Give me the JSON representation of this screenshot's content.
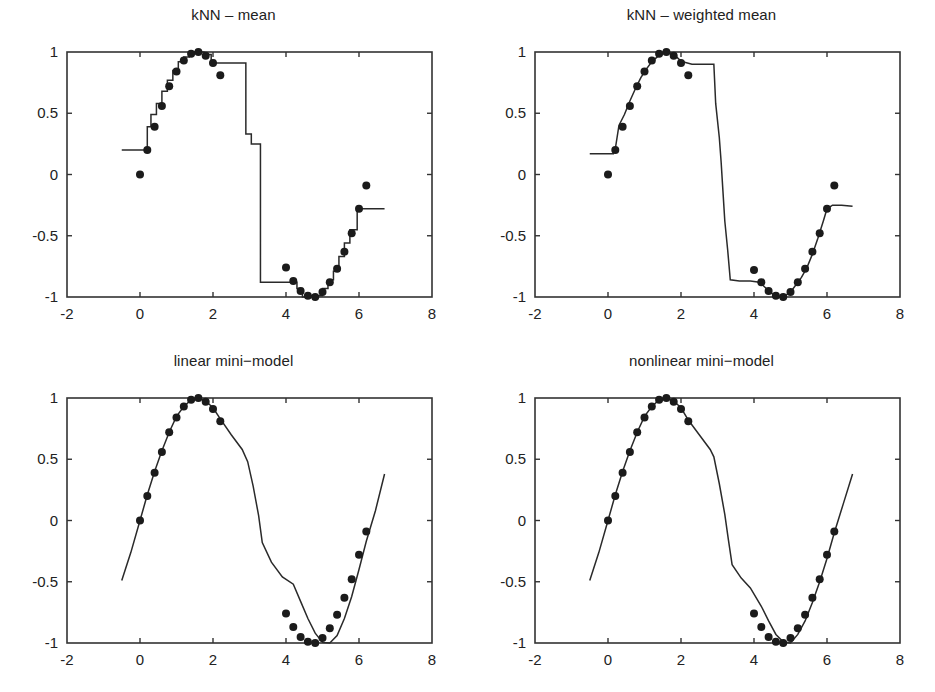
{
  "figure": {
    "width": 935,
    "height": 692,
    "background": "#ffffff",
    "line_color": "#2a2a2a",
    "marker_color": "#1b1b1b",
    "axis_color": "#333333",
    "layout": "2x2 grid of subplots"
  },
  "panels": [
    {
      "id": "knn-mean",
      "title": "kNN – mean"
    },
    {
      "id": "knn-weighted-mean",
      "title": "kNN – weighted mean"
    },
    {
      "id": "linear-mini-model",
      "title": "linear mini−model"
    },
    {
      "id": "nonlinear-mini-model",
      "title": "nonlinear mini−model"
    }
  ],
  "axes": {
    "xlim": [
      -2,
      8
    ],
    "ylim": [
      -1,
      1
    ],
    "xticks": [
      -2,
      0,
      2,
      4,
      6,
      8
    ],
    "xticklabels": [
      "-2",
      "0",
      "2",
      "4",
      "6",
      "8"
    ],
    "yticks": [
      -1,
      -0.5,
      0,
      0.5,
      1
    ],
    "yticklabels": [
      "-1",
      "-0.5",
      "0",
      "0.5",
      "1"
    ],
    "grid": false,
    "box": true
  },
  "chart_data": [
    {
      "type": "line",
      "id": "knn-mean",
      "title": "kNN – mean",
      "xlabel": "",
      "ylabel": "",
      "xlim": [
        -2,
        8
      ],
      "ylim": [
        -1,
        1
      ],
      "grid": false,
      "legend": "none",
      "series": [
        {
          "name": "training data",
          "style": "scatter",
          "marker": "filled-circle",
          "x": [
            0.0,
            0.2,
            0.4,
            0.6,
            0.8,
            1.0,
            1.2,
            1.4,
            1.6,
            1.8,
            2.0,
            2.2,
            4.0,
            4.2,
            4.4,
            4.6,
            4.8,
            5.0,
            5.2,
            5.4,
            5.6,
            5.8,
            6.0,
            6.2
          ],
          "y": [
            0.0,
            0.2,
            0.39,
            0.56,
            0.72,
            0.84,
            0.93,
            0.985,
            1.0,
            0.97,
            0.91,
            0.81,
            -0.76,
            -0.87,
            -0.95,
            -0.99,
            -1.0,
            -0.96,
            -0.88,
            -0.77,
            -0.63,
            -0.48,
            -0.28,
            -0.09
          ]
        },
        {
          "name": "kNN mean prediction",
          "style": "staircase",
          "x": [
            -0.5,
            0.2,
            0.2,
            0.3,
            0.3,
            0.45,
            0.45,
            0.6,
            0.6,
            0.75,
            0.75,
            0.9,
            0.9,
            1.05,
            1.05,
            1.2,
            1.2,
            1.35,
            1.35,
            1.5,
            1.5,
            1.75,
            1.75,
            1.95,
            1.95,
            2.05,
            2.05,
            2.9,
            2.9,
            3.05,
            3.05,
            3.3,
            3.3,
            4.3,
            4.3,
            4.45,
            4.45,
            4.6,
            4.6,
            5.0,
            5.0,
            5.15,
            5.15,
            5.3,
            5.3,
            5.45,
            5.45,
            5.6,
            5.6,
            5.75,
            5.75,
            5.95,
            5.95,
            6.7
          ],
          "y": [
            0.2,
            0.2,
            0.39,
            0.39,
            0.49,
            0.49,
            0.58,
            0.58,
            0.68,
            0.68,
            0.77,
            0.77,
            0.85,
            0.85,
            0.92,
            0.92,
            0.96,
            0.96,
            0.99,
            0.99,
            1.0,
            1.0,
            0.98,
            0.98,
            0.93,
            0.93,
            0.91,
            0.91,
            0.33,
            0.33,
            0.25,
            0.25,
            -0.88,
            -0.88,
            -0.93,
            -0.93,
            -1.0,
            -1.0,
            -0.99,
            -0.99,
            -0.93,
            -0.93,
            -0.86,
            -0.86,
            -0.79,
            -0.79,
            -0.67,
            -0.67,
            -0.56,
            -0.56,
            -0.45,
            -0.45,
            -0.28,
            -0.28
          ]
        }
      ]
    },
    {
      "type": "line",
      "id": "knn-weighted-mean",
      "title": "kNN – weighted mean",
      "xlabel": "",
      "ylabel": "",
      "xlim": [
        -2,
        8
      ],
      "ylim": [
        -1,
        1
      ],
      "grid": false,
      "legend": "none",
      "series": [
        {
          "name": "training data",
          "style": "scatter",
          "marker": "filled-circle",
          "x": [
            0.0,
            0.2,
            0.4,
            0.6,
            0.8,
            1.0,
            1.2,
            1.4,
            1.6,
            1.8,
            2.0,
            2.2,
            4.0,
            4.2,
            4.4,
            4.6,
            4.8,
            5.0,
            5.2,
            5.4,
            5.6,
            5.8,
            6.0,
            6.2
          ],
          "y": [
            0.0,
            0.2,
            0.39,
            0.56,
            0.72,
            0.84,
            0.93,
            0.985,
            1.0,
            0.97,
            0.91,
            0.81,
            -0.78,
            -0.88,
            -0.95,
            -0.99,
            -1.0,
            -0.96,
            -0.88,
            -0.77,
            -0.63,
            -0.48,
            -0.28,
            -0.09
          ]
        },
        {
          "name": "kNN weighted mean prediction",
          "style": "piecewise",
          "x": [
            -0.5,
            -0.1,
            0.15,
            0.2,
            0.3,
            0.45,
            0.6,
            0.75,
            0.9,
            1.05,
            1.2,
            1.35,
            1.5,
            1.65,
            1.8,
            1.95,
            2.05,
            2.3,
            2.6,
            2.9,
            2.95,
            3.05,
            3.1,
            3.15,
            3.2,
            3.28,
            3.35,
            3.6,
            3.9,
            4.15,
            4.3,
            4.45,
            4.6,
            4.8,
            5.0,
            5.15,
            5.3,
            5.45,
            5.6,
            5.75,
            5.9,
            6.0,
            6.15,
            6.4,
            6.7
          ],
          "y": [
            0.17,
            0.17,
            0.17,
            0.21,
            0.4,
            0.49,
            0.6,
            0.7,
            0.79,
            0.86,
            0.92,
            0.96,
            0.99,
            1.0,
            0.98,
            0.94,
            0.92,
            0.9,
            0.9,
            0.9,
            0.58,
            0.3,
            0.1,
            -0.14,
            -0.38,
            -0.62,
            -0.86,
            -0.87,
            -0.87,
            -0.88,
            -0.92,
            -0.96,
            -1.0,
            -1.0,
            -0.96,
            -0.9,
            -0.84,
            -0.76,
            -0.65,
            -0.52,
            -0.38,
            -0.28,
            -0.25,
            -0.25,
            -0.26
          ]
        }
      ]
    },
    {
      "type": "line",
      "id": "linear-mini-model",
      "title": "linear mini−model",
      "xlabel": "",
      "ylabel": "",
      "xlim": [
        -2,
        8
      ],
      "ylim": [
        -1,
        1
      ],
      "grid": false,
      "legend": "none",
      "series": [
        {
          "name": "training data",
          "style": "scatter",
          "marker": "filled-circle",
          "x": [
            0.0,
            0.2,
            0.4,
            0.6,
            0.8,
            1.0,
            1.2,
            1.4,
            1.6,
            1.8,
            2.0,
            2.2,
            4.0,
            4.2,
            4.4,
            4.6,
            4.8,
            5.0,
            5.2,
            5.4,
            5.6,
            5.8,
            6.0,
            6.2
          ],
          "y": [
            0.0,
            0.2,
            0.39,
            0.56,
            0.72,
            0.84,
            0.93,
            0.985,
            1.0,
            0.97,
            0.91,
            0.81,
            -0.76,
            -0.87,
            -0.95,
            -0.99,
            -1.0,
            -0.96,
            -0.88,
            -0.77,
            -0.63,
            -0.48,
            -0.28,
            -0.09
          ]
        },
        {
          "name": "linear mini-model prediction",
          "style": "piecewise",
          "x": [
            -0.5,
            -0.25,
            0.0,
            0.2,
            0.4,
            0.6,
            0.8,
            1.0,
            1.2,
            1.4,
            1.6,
            1.8,
            2.0,
            2.2,
            2.5,
            2.8,
            2.95,
            3.1,
            3.25,
            3.35,
            3.6,
            3.9,
            4.2,
            4.4,
            4.6,
            4.8,
            5.0,
            5.2,
            5.4,
            5.6,
            5.8,
            6.0,
            6.2,
            6.45,
            6.7
          ],
          "y": [
            -0.49,
            -0.26,
            0.0,
            0.21,
            0.4,
            0.57,
            0.72,
            0.85,
            0.93,
            0.985,
            1.0,
            0.975,
            0.92,
            0.83,
            0.7,
            0.58,
            0.48,
            0.28,
            0.04,
            -0.18,
            -0.34,
            -0.46,
            -0.52,
            -0.66,
            -0.8,
            -0.92,
            -0.995,
            -1.0,
            -0.94,
            -0.8,
            -0.62,
            -0.4,
            -0.17,
            0.08,
            0.38
          ]
        }
      ]
    },
    {
      "type": "line",
      "id": "nonlinear-mini-model",
      "title": "nonlinear mini−model",
      "xlabel": "",
      "ylabel": "",
      "xlim": [
        -2,
        8
      ],
      "ylim": [
        -1,
        1
      ],
      "grid": false,
      "legend": "none",
      "series": [
        {
          "name": "training data",
          "style": "scatter",
          "marker": "filled-circle",
          "x": [
            0.0,
            0.2,
            0.4,
            0.6,
            0.8,
            1.0,
            1.2,
            1.4,
            1.6,
            1.8,
            2.0,
            2.2,
            4.0,
            4.2,
            4.4,
            4.6,
            4.8,
            5.0,
            5.2,
            5.4,
            5.6,
            5.8,
            6.0,
            6.2
          ],
          "y": [
            0.0,
            0.2,
            0.39,
            0.56,
            0.72,
            0.84,
            0.93,
            0.985,
            1.0,
            0.97,
            0.91,
            0.81,
            -0.76,
            -0.87,
            -0.95,
            -0.99,
            -1.0,
            -0.96,
            -0.88,
            -0.77,
            -0.63,
            -0.48,
            -0.28,
            -0.09
          ]
        },
        {
          "name": "nonlinear mini-model prediction",
          "style": "piecewise",
          "x": [
            -0.5,
            -0.25,
            0.0,
            0.2,
            0.4,
            0.6,
            0.8,
            1.0,
            1.2,
            1.4,
            1.6,
            1.8,
            2.0,
            2.2,
            2.5,
            2.8,
            2.9,
            3.05,
            3.2,
            3.3,
            3.4,
            3.65,
            3.9,
            4.2,
            4.4,
            4.6,
            4.8,
            5.0,
            5.2,
            5.4,
            5.6,
            5.8,
            6.0,
            6.2,
            6.45,
            6.7
          ],
          "y": [
            -0.49,
            -0.26,
            0.0,
            0.21,
            0.4,
            0.57,
            0.72,
            0.85,
            0.93,
            0.985,
            1.0,
            0.975,
            0.92,
            0.82,
            0.7,
            0.58,
            0.52,
            0.3,
            0.05,
            -0.16,
            -0.36,
            -0.47,
            -0.55,
            -0.7,
            -0.82,
            -0.93,
            -0.99,
            -1.0,
            -0.93,
            -0.82,
            -0.67,
            -0.5,
            -0.31,
            -0.1,
            0.14,
            0.38
          ]
        }
      ]
    }
  ]
}
